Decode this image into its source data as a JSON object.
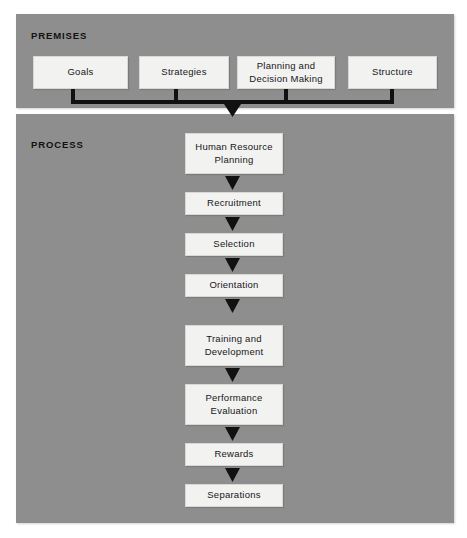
{
  "diagram": {
    "colors": {
      "panel_gray": "#8e8e8e",
      "box_fill": "#f2f2f0",
      "box_border": "#d8d8d4",
      "connector_black": "#111111",
      "page_background": "#ffffff"
    }
  },
  "premises": {
    "label": "PREMISES",
    "boxes": [
      {
        "label": "Goals"
      },
      {
        "label": "Strategies"
      },
      {
        "label": "Planning and\nDecision Making",
        "line1": "Planning and",
        "line2": "Decision Making"
      },
      {
        "label": "Structure"
      }
    ]
  },
  "process": {
    "label": "PROCESS",
    "boxes": [
      {
        "label": "Human Resource\nPlanning",
        "line1": "Human Resource",
        "line2": "Planning"
      },
      {
        "label": "Recruitment",
        "line1": "Recruitment",
        "line2": ""
      },
      {
        "label": "Selection",
        "line1": "Selection",
        "line2": ""
      },
      {
        "label": "Orientation",
        "line1": "Orientation",
        "line2": ""
      },
      {
        "label": "Training and\nDevelopment",
        "line1": "Training and",
        "line2": "Development"
      },
      {
        "label": "Performance\nEvaluation",
        "line1": "Performance",
        "line2": "Evaluation"
      },
      {
        "label": "Rewards",
        "line1": "Rewards",
        "line2": ""
      },
      {
        "label": "Separations",
        "line1": "Separations",
        "line2": ""
      }
    ]
  },
  "connectors": {
    "bus_description": "Four vertical stubs from premises boxes joining a horizontal bus, feeding one downward arrow into the process flow",
    "stub_count": 4,
    "arrow_count": 8
  }
}
